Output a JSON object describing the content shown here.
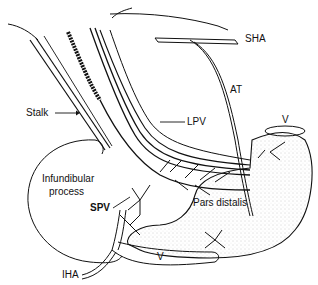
{
  "figure": {
    "colors": {
      "ink": "#111111",
      "background": "#ffffff",
      "stipple": "#9a9a9a"
    },
    "labels": {
      "sha": "SHA",
      "at": "AT",
      "stalk": "Stalk",
      "lpv": "LPV",
      "v_top": "V",
      "infundibular_process_line1": "Infundibular",
      "infundibular_process_line2": "process",
      "spv": "SPV",
      "pars_distalis": "Pars distalis",
      "iha": "IHA",
      "v_bottom": "V"
    }
  }
}
